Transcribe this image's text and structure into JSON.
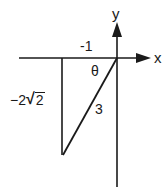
{
  "diagram": {
    "type": "reference-triangle",
    "axes": {
      "x_label": "x",
      "y_label": "y"
    },
    "angle_label": "θ",
    "sides": {
      "horizontal": "-1",
      "vertical_prefix": "−2",
      "vertical_radicand": "2",
      "hypotenuse": "3"
    },
    "colors": {
      "stroke": "#1a1a1a",
      "background": "#ffffff"
    }
  }
}
